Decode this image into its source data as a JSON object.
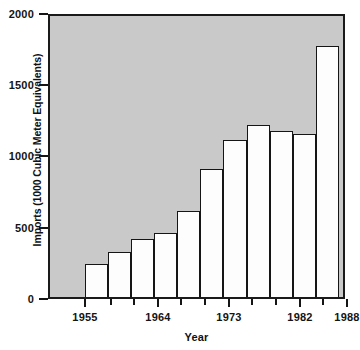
{
  "chart_data": {
    "type": "bar",
    "title": "",
    "xlabel": "Year",
    "ylabel": "Imports (1000 Cubic Meter Equivalents)",
    "ylim": [
      0,
      2000
    ],
    "ytick_values": [
      0,
      500,
      1000,
      1500,
      2000
    ],
    "ytick_labels": [
      "0",
      "500",
      "1000",
      "1500",
      "2000"
    ],
    "xtick_labels": [
      "1955",
      "1964",
      "1973",
      "1982",
      "1988"
    ],
    "grid": false,
    "legend": null,
    "plot_background": "#c9c9c9",
    "bar_fill": "#fdfdfd",
    "bar_edge": "#151515",
    "categories": [
      "1958",
      "1961",
      "1964",
      "1967",
      "1970",
      "1973",
      "1976",
      "1979",
      "1982",
      "1985",
      "1988"
    ],
    "values": [
      235,
      315,
      405,
      450,
      605,
      900,
      1105,
      1210,
      1165,
      1145,
      1760
    ],
    "bars": [
      {
        "label": "1958",
        "value": 235,
        "left_pct": 11.8,
        "width_pct": 7.9
      },
      {
        "label": "1961",
        "value": 315,
        "left_pct": 19.7,
        "width_pct": 7.9
      },
      {
        "label": "1964",
        "value": 405,
        "left_pct": 27.6,
        "width_pct": 7.9
      },
      {
        "label": "1967",
        "value": 450,
        "left_pct": 35.5,
        "width_pct": 7.9
      },
      {
        "label": "1970",
        "value": 605,
        "left_pct": 43.4,
        "width_pct": 7.9
      },
      {
        "label": "1973",
        "value": 900,
        "left_pct": 51.3,
        "width_pct": 7.9
      },
      {
        "label": "1976",
        "value": 1105,
        "left_pct": 59.2,
        "width_pct": 7.9
      },
      {
        "label": "1979",
        "value": 1210,
        "left_pct": 67.1,
        "width_pct": 7.9
      },
      {
        "label": "1982",
        "value": 1165,
        "left_pct": 75.0,
        "width_pct": 7.9
      },
      {
        "label": "1985",
        "value": 1145,
        "left_pct": 82.9,
        "width_pct": 7.9
      },
      {
        "label": "1988",
        "value": 1760,
        "left_pct": 90.8,
        "width_pct": 7.9
      }
    ],
    "y_ticks_px": [
      {
        "label": "2000",
        "top": 14
      },
      {
        "label": "1500",
        "top": 85
      },
      {
        "label": "1000",
        "top": 156
      },
      {
        "label": "500",
        "top": 228
      },
      {
        "label": "0",
        "top": 299
      }
    ],
    "x_ticks_px": [
      {
        "label": "1955",
        "x": 36,
        "major": true
      },
      {
        "label": "",
        "x": 62,
        "major": false
      },
      {
        "label": "",
        "x": 85,
        "major": false
      },
      {
        "label": "1964",
        "x": 109,
        "major": true
      },
      {
        "label": "",
        "x": 132,
        "major": false
      },
      {
        "label": "",
        "x": 156,
        "major": false
      },
      {
        "label": "1973",
        "x": 180,
        "major": true
      },
      {
        "label": "",
        "x": 203,
        "major": false
      },
      {
        "label": "",
        "x": 227,
        "major": false
      },
      {
        "label": "1982",
        "x": 251,
        "major": true
      },
      {
        "label": "",
        "x": 274,
        "major": false
      },
      {
        "label": "1988",
        "x": 298,
        "major": true
      }
    ]
  }
}
